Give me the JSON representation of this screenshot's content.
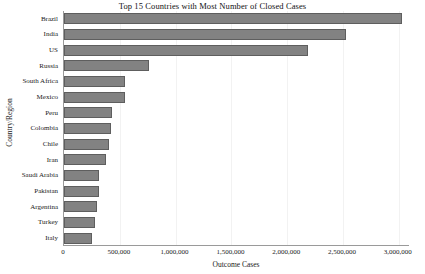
{
  "chart_data": {
    "type": "bar",
    "orientation": "horizontal",
    "title": "Top 15 Countries with Most Number of Closed Cases",
    "xlabel": "Outcome Cases",
    "ylabel": "Country/Region",
    "categories": [
      "Brazil",
      "India",
      "US",
      "Russia",
      "South Africa",
      "Mexico",
      "Peru",
      "Colombia",
      "Chile",
      "Iran",
      "Saudi Arabia",
      "Pakistan",
      "Argentina",
      "Turkey",
      "Italy"
    ],
    "values": [
      3030000,
      2530000,
      2190000,
      760000,
      545000,
      545000,
      430000,
      425000,
      405000,
      375000,
      310000,
      310000,
      295000,
      275000,
      255000
    ],
    "xlim": [
      0,
      3100000
    ],
    "xticks": [
      0,
      500000,
      1000000,
      1500000,
      2000000,
      2500000,
      3000000
    ],
    "xticklabels": [
      "0",
      "500,000",
      "1,000,000",
      "1,500,000",
      "2,000,000",
      "2,500,000",
      "3,000,000"
    ],
    "grid": true,
    "legend": false,
    "bar_color": "#828282",
    "bar_edge_color": "#5e5e5e"
  }
}
